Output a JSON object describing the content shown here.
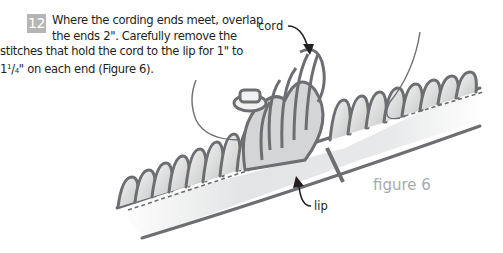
{
  "step": {
    "number": "12",
    "lines": [
      "Where the cording ends meet, overlap",
      "the ends 2\". Carefully remove the",
      "stitches that hold the cord to the lip for 1\" to",
      " on each end (Figure 6)."
    ],
    "fraction": {
      "whole": "1",
      "num": "1",
      "den": "4",
      "unit": "\""
    }
  },
  "figure": {
    "labels": {
      "cord": "cord",
      "lip": "lip"
    },
    "caption": "figure 6",
    "colors": {
      "stroke": "#6d6e71",
      "fill_light": "#e6e7e8",
      "fill_mid": "#c7c8ca",
      "caption": "#a7a9ac",
      "badge": "#b5b5b5"
    }
  }
}
